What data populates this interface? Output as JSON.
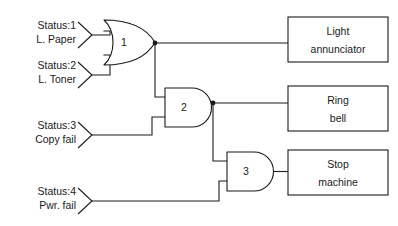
{
  "diagram": {
    "background_color": "#ffffff",
    "line_color": "#1a1a1a",
    "inputs": [
      {
        "id": "in1",
        "status": "Status:1",
        "name": "L. Paper"
      },
      {
        "id": "in2",
        "status": "Status:2",
        "name": "L. Toner"
      },
      {
        "id": "in3",
        "status": "Status:3",
        "name": "Copy fail"
      },
      {
        "id": "in4",
        "status": "Status:4",
        "name": "Pwr. fail"
      }
    ],
    "gates": [
      {
        "id": "g1",
        "label": "1",
        "type": "or"
      },
      {
        "id": "g2",
        "label": "2",
        "type": "and"
      },
      {
        "id": "g3",
        "label": "3",
        "type": "and"
      }
    ],
    "outputs": [
      {
        "id": "out1",
        "line1": "Light",
        "line2": "annunciator"
      },
      {
        "id": "out2",
        "line1": "Ring",
        "line2": "bell"
      },
      {
        "id": "out3",
        "line1": "Stop",
        "line2": "machine"
      }
    ]
  }
}
